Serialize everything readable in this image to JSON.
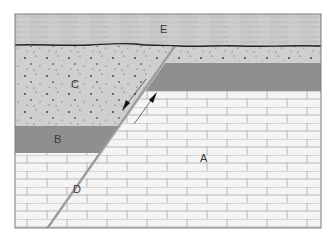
{
  "diagram": {
    "type": "geologic-cross-section",
    "labels": {
      "A": "A",
      "B": "B",
      "C": "C",
      "D": "D",
      "E": "E"
    },
    "units": [
      {
        "id": "E",
        "description": "Top horizontal layer (finely laminated), above erosional unconformity"
      },
      {
        "id": "C",
        "description": "Speckled sandstone layer, offset across fault"
      },
      {
        "id": "B",
        "description": "Dark gray shale band, offset across fault"
      },
      {
        "id": "A",
        "description": "Brick-pattern limestone basement"
      },
      {
        "id": "D",
        "description": "Inclined fault plane"
      }
    ],
    "fault": {
      "sense_arrows": "Hanging wall (left) down, footwall (right) up",
      "dip_direction": "left"
    },
    "colors": {
      "layer_E": "#c8c8c8",
      "layer_C": "#cfcfcf",
      "shale": "#8f8f8f",
      "limestone": "#f4f4f4",
      "brick_lines": "#a6a6a6",
      "unconformity": "#222222",
      "fault": "#9a9a9a",
      "frame": "#7a7a7a"
    }
  }
}
